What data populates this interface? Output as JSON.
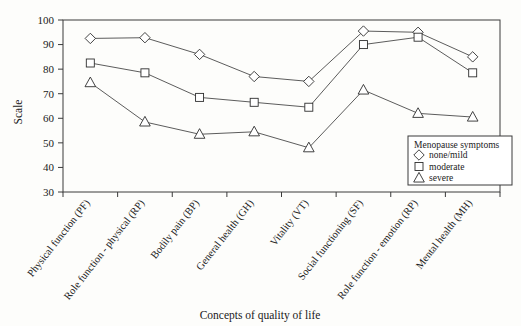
{
  "chart_data": {
    "type": "line",
    "title": "",
    "xlabel": "Concepts of quality of life",
    "ylabel": "Scale",
    "ylim": [
      30,
      100
    ],
    "ytick_labels": [
      "30",
      "40",
      "50",
      "60",
      "70",
      "80",
      "90",
      "100"
    ],
    "ytick_values": [
      30,
      40,
      50,
      60,
      70,
      80,
      90,
      100
    ],
    "grid": false,
    "legend_position": "bottom-right",
    "legend_title": "Menopause symptoms",
    "categories": [
      "Physical function (PF)",
      "Role function - physical (RP)",
      "Bodily pain (BP)",
      "General health (GH)",
      "Vitality (VT)",
      "Social functioning (SF)",
      "Role function - emotion (RP)",
      "Mental health (MH)"
    ],
    "series": [
      {
        "name": "none/mild",
        "marker": "diamond",
        "values": [
          92.5,
          92.8,
          86,
          77,
          75,
          95.5,
          95,
          85
        ]
      },
      {
        "name": "moderate",
        "marker": "square",
        "values": [
          82.5,
          78.5,
          68.5,
          66.5,
          64.5,
          90,
          93,
          78.5
        ]
      },
      {
        "name": "severe",
        "marker": "triangle",
        "values": [
          74.5,
          58.5,
          53.5,
          54.5,
          48,
          71.5,
          62,
          60.5
        ]
      }
    ]
  },
  "colors": {
    "background": "#fdfdfb",
    "axis": "#3a3a3a",
    "line": "#4a4a4a",
    "marker_fill": "#ffffff",
    "marker_stroke": "#2e2e2e",
    "text": "#1a1a1a"
  },
  "legend": {
    "title": "Menopause symptoms",
    "items": [
      {
        "label": "none/mild",
        "icon": "diamond-marker-icon"
      },
      {
        "label": "moderate",
        "icon": "square-marker-icon"
      },
      {
        "label": "severe",
        "icon": "triangle-marker-icon"
      }
    ]
  }
}
